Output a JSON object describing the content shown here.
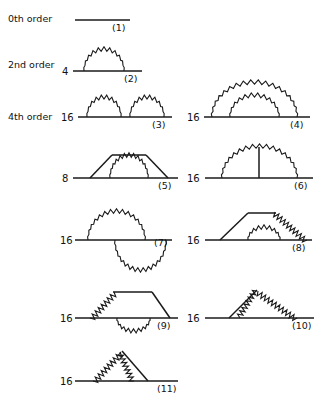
{
  "figure": {
    "title_present": false,
    "background_color": "#ffffff",
    "line_color": "#1a1a1a",
    "width": 325,
    "height": 412
  },
  "order_labels": [
    {
      "text": "0th order",
      "x": 8,
      "y": 22
    },
    {
      "text": "2nd order",
      "x": 8,
      "y": 68
    },
    {
      "text": "4th order",
      "x": 8,
      "y": 120
    }
  ],
  "diagrams": [
    {
      "id": 1,
      "number_label": "(1)",
      "count_label": "",
      "order": "0th order",
      "baseline_y": 20,
      "baseline_x0": 75,
      "baseline_x1": 130,
      "number_x": 112,
      "number_y": 31,
      "count_x": 0,
      "count_y": 0,
      "photons": [],
      "extra_lines": []
    },
    {
      "id": 2,
      "number_label": "(2)",
      "count_label": "4",
      "order": "2nd order",
      "baseline_y": 71,
      "baseline_x0": 73,
      "baseline_x1": 142,
      "number_x": 124,
      "number_y": 82,
      "count_x": 62,
      "count_y": 75,
      "photons": [
        {
          "type": "arc",
          "x0": 84,
          "x1": 124,
          "height": 21,
          "zigs": 11
        }
      ],
      "extra_lines": []
    },
    {
      "id": 3,
      "number_label": "(3)",
      "count_label": "16",
      "order": "4th order",
      "baseline_y": 117,
      "baseline_x0": 78,
      "baseline_x1": 172,
      "number_x": 152,
      "number_y": 128,
      "count_x": 61,
      "count_y": 121,
      "photons": [
        {
          "type": "arc",
          "x0": 87,
          "x1": 121,
          "height": 19,
          "zigs": 10
        },
        {
          "type": "arc",
          "x0": 130,
          "x1": 164,
          "height": 19,
          "zigs": 10
        }
      ],
      "extra_lines": []
    },
    {
      "id": 4,
      "number_label": "(4)",
      "count_label": "16",
      "order": "4th order",
      "baseline_y": 117,
      "baseline_x0": 204,
      "baseline_x1": 310,
      "number_x": 290,
      "number_y": 128,
      "count_x": 187,
      "count_y": 121,
      "photons": [
        {
          "type": "arc",
          "x0": 212,
          "x1": 297,
          "height": 34,
          "zigs": 18
        },
        {
          "type": "arc",
          "x0": 230,
          "x1": 279,
          "height": 21,
          "zigs": 12
        }
      ],
      "extra_lines": []
    },
    {
      "id": 5,
      "number_label": "(5)",
      "count_label": "8",
      "order": "4th order",
      "baseline_y": 178,
      "baseline_x0": 73,
      "baseline_x1": 178,
      "number_x": 158,
      "number_y": 189,
      "count_x": 62,
      "count_y": 182,
      "photons": [
        {
          "type": "arc",
          "x0": 110,
          "x1": 148,
          "height": 22,
          "zigs": 13
        }
      ],
      "extra_lines": [
        {
          "x1": 90,
          "y1": 178,
          "x2": 112,
          "y2": 155
        },
        {
          "x1": 112,
          "y1": 155,
          "x2": 146,
          "y2": 155
        },
        {
          "x1": 146,
          "y1": 155,
          "x2": 168,
          "y2": 178
        }
      ]
    },
    {
      "id": 6,
      "number_label": "(6)",
      "count_label": "16",
      "order": "4th order",
      "baseline_y": 178,
      "baseline_x0": 205,
      "baseline_x1": 313,
      "number_x": 294,
      "number_y": 189,
      "count_x": 187,
      "count_y": 182,
      "photons": [
        {
          "type": "arc",
          "x0": 222,
          "x1": 297,
          "height": 31,
          "zigs": 17
        }
      ],
      "extra_lines": [
        {
          "x1": 259,
          "y1": 147,
          "x2": 259,
          "y2": 178
        }
      ]
    },
    {
      "id": 7,
      "number_label": "(7)",
      "count_label": "16",
      "order": "4th order",
      "baseline_y": 240,
      "baseline_x0": 75,
      "baseline_x1": 172,
      "number_x": 154,
      "number_y": 246,
      "count_x": 60,
      "count_y": 244,
      "photons": [
        {
          "type": "arc",
          "x0": 88,
          "x1": 145,
          "height": 28,
          "zigs": 15
        },
        {
          "type": "arc-down",
          "x0": 115,
          "x1": 166,
          "height": 29,
          "zigs": 15
        }
      ],
      "extra_lines": []
    },
    {
      "id": 8,
      "number_label": "(8)",
      "count_label": "16",
      "order": "4th order",
      "baseline_y": 240,
      "baseline_x0": 205,
      "baseline_x1": 312,
      "number_x": 292,
      "number_y": 251,
      "count_x": 187,
      "count_y": 244,
      "photons": [
        {
          "type": "arc",
          "x0": 248,
          "x1": 280,
          "height": 12,
          "zigs": 9
        },
        {
          "type": "slope-zig",
          "x1": 275,
          "y1": 212,
          "x2": 307,
          "y2": 240,
          "zigs": 10,
          "amp": 4.5
        }
      ],
      "extra_lines": [
        {
          "x1": 220,
          "y1": 240,
          "x2": 248,
          "y2": 213
        },
        {
          "x1": 248,
          "y1": 213,
          "x2": 276,
          "y2": 213
        }
      ]
    },
    {
      "id": 9,
      "number_label": "(9)",
      "count_label": "16",
      "order": "4th order",
      "baseline_y": 318,
      "baseline_x0": 75,
      "baseline_x1": 178,
      "number_x": 157,
      "number_y": 329,
      "count_x": 60,
      "count_y": 322,
      "photons": [
        {
          "type": "slope-zig",
          "x1": 90,
          "y1": 318,
          "x2": 114,
          "y2": 292,
          "zigs": 8,
          "amp": 4.5
        },
        {
          "type": "arc",
          "x0": 117,
          "x1": 150,
          "height": -12,
          "zigs": 10
        }
      ],
      "extra_lines": [
        {
          "x1": 113,
          "y1": 292,
          "x2": 152,
          "y2": 292
        },
        {
          "x1": 152,
          "y1": 292,
          "x2": 170,
          "y2": 318
        }
      ]
    },
    {
      "id": 10,
      "number_label": "(10)",
      "count_label": "16",
      "order": "4th order",
      "baseline_y": 318,
      "baseline_x0": 205,
      "baseline_x1": 314,
      "number_x": 292,
      "number_y": 329,
      "count_x": 187,
      "count_y": 322,
      "photons": [
        {
          "type": "slope-zig",
          "x1": 257,
          "y1": 291,
          "x2": 240,
          "y2": 318,
          "zigs": 8,
          "amp": 4.2
        },
        {
          "type": "slope-zig",
          "x1": 258,
          "y1": 291,
          "x2": 297,
          "y2": 318,
          "zigs": 11,
          "amp": 4.5
        }
      ],
      "extra_lines": [
        {
          "x1": 229,
          "y1": 318,
          "x2": 257,
          "y2": 290
        }
      ]
    },
    {
      "id": 11,
      "number_label": "(11)",
      "count_label": "16",
      "order": "4th order",
      "baseline_y": 381,
      "baseline_x0": 75,
      "baseline_x1": 178,
      "number_x": 157,
      "number_y": 392,
      "count_x": 60,
      "count_y": 385,
      "photons": [
        {
          "type": "slope-zig",
          "x1": 93,
          "y1": 381,
          "x2": 120,
          "y2": 352,
          "zigs": 9,
          "amp": 4.5
        },
        {
          "type": "slope-zig",
          "x1": 121,
          "y1": 352,
          "x2": 134,
          "y2": 381,
          "zigs": 8,
          "amp": 4.2
        }
      ],
      "extra_lines": [
        {
          "x1": 122,
          "y1": 351,
          "x2": 148,
          "y2": 381
        }
      ]
    }
  ]
}
